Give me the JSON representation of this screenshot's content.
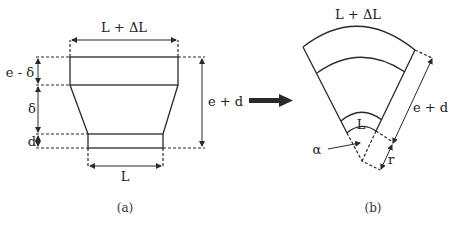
{
  "figure_a": {
    "caption": "(a)",
    "labels": {
      "top_width": "L + ΔL",
      "bottom_width": "L",
      "height_top": "e - δ",
      "height_mid": "δ",
      "height_bottom": "d",
      "total_height": "e + d"
    }
  },
  "transition_arrow": {
    "direction": "right"
  },
  "figure_b": {
    "caption": "(b)",
    "labels": {
      "outer_arc": "L + ΔL",
      "inner_arc": "L",
      "radial_length": "e + d",
      "radius": "r",
      "angle": "α"
    }
  },
  "colors": {
    "line": "#2a2a2a",
    "background": "#ffffff"
  }
}
